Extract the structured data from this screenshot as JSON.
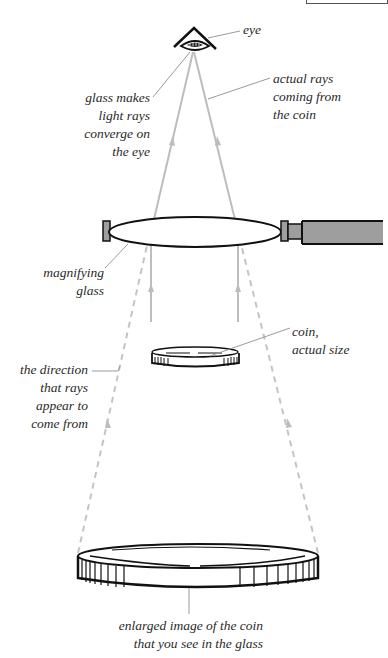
{
  "diagram": {
    "colors": {
      "outline": "#111111",
      "ray": "#b8b8b8",
      "leader": "#9a9a9a",
      "handle": "#9e9e9e",
      "text": "#2a2a2a"
    },
    "labels": {
      "eye": "eye",
      "glass_converge": [
        "glass makes",
        "light rays",
        "converge on",
        "the eye"
      ],
      "actual_rays": [
        "actual rays",
        "coming from",
        "the coin"
      ],
      "magnifying_glass": [
        "magnifying",
        "glass"
      ],
      "coin_actual": [
        "coin,",
        "actual size"
      ],
      "apparent_direction": [
        "the direction",
        "that rays",
        "appear to",
        "come from"
      ],
      "enlarged_image": [
        "enlarged image of the coin",
        "that you see in the glass"
      ]
    },
    "components": [
      {
        "name": "eye",
        "icon": "eye-icon"
      },
      {
        "name": "magnifying glass",
        "icon": "lens-icon"
      },
      {
        "name": "coin actual size",
        "icon": "coin-icon"
      },
      {
        "name": "enlarged coin image",
        "icon": "coin-icon"
      }
    ]
  }
}
